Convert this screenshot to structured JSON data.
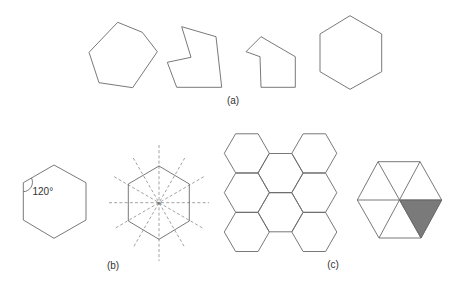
{
  "figure": {
    "part_a": {
      "label": "(a)",
      "shapes": [
        {
          "name": "irregular-convex-hexagon",
          "points": "117.7,22.3 142.3,32.3 157.3,51.7 132.7,87.7 99,82.7 89,52.3"
        },
        {
          "name": "concave-hexagon",
          "points": "181.7,26.7 216,36.7 221.7,87.3 176.7,87.3 167.3,62.3 191,57.3"
        },
        {
          "name": "concave-hexagon-2",
          "points": "261,36.7 295.3,56.7 295.3,87.3 261,87.3 260,56.7 246,51.7"
        },
        {
          "name": "regular-hexagon",
          "points": "350,15.7 381.7,34 381.7,71.7 350,89.3 320,71.7 320,34"
        }
      ]
    },
    "part_b": {
      "label": "(b)",
      "angle_label": "120°",
      "center_label": "π",
      "hexagon_angle": {
        "points": "54,165 86,182.7 86,220 54,238.3 23.3,220 23.3,182.7"
      },
      "hexagon_symmetry": {
        "points": "159,166 189.3,184 189.3,221 159,239.3 128.3,221 128.3,184"
      }
    },
    "part_c": {
      "label": "(c)",
      "tessellation_centers": [
        [
          246.8,
          153.3
        ],
        [
          246.8,
          192.7
        ],
        [
          246.8,
          232
        ],
        [
          280.5,
          173
        ],
        [
          280.5,
          212.3
        ],
        [
          314.3,
          153.3
        ],
        [
          314.3,
          192.7
        ],
        [
          314.3,
          232
        ]
      ],
      "triangulated_hexagon": {
        "points": "357.3,200 378,161.7 420,161.7 441.7,200 421,238 379,238",
        "center": [
          399.5,
          200
        ],
        "shaded_triangle": "399.5,200 441.7,200 421,238",
        "shade_color": "#7a7a7a"
      }
    }
  }
}
